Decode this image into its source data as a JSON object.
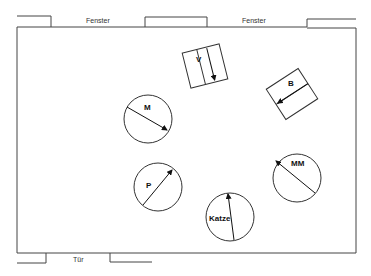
{
  "diagram": {
    "type": "floor-plan",
    "wall_labels": {
      "window_left": "Fenster",
      "window_right": "Fenster",
      "door": "Tür"
    },
    "furniture": [
      {
        "id": "V",
        "label": "V",
        "shape": "rectangle",
        "arrow": "down"
      },
      {
        "id": "B",
        "label": "B",
        "shape": "rectangle",
        "arrow": "left-down"
      }
    ],
    "seats": [
      {
        "id": "M",
        "label": "M",
        "shape": "circle",
        "arrow": "down-right"
      },
      {
        "id": "MM",
        "label": "MM",
        "shape": "circle",
        "arrow": "up-left"
      },
      {
        "id": "P",
        "label": "P",
        "shape": "circle",
        "arrow": "up-right"
      },
      {
        "id": "Katze",
        "label": "Katze",
        "shape": "circle",
        "arrow": "up"
      }
    ],
    "colors": {
      "line": "#333333",
      "background": "#ffffff"
    }
  }
}
